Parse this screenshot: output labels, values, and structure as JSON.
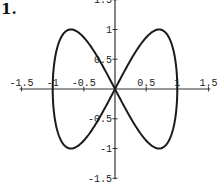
{
  "problem": {
    "number_label": "1."
  },
  "chart_data": {
    "type": "line",
    "title": "",
    "xlabel": "",
    "ylabel": "",
    "parametric": {
      "x": "sin(t)",
      "y": "sin(2t)",
      "t_range": [
        0,
        6.2832
      ]
    },
    "x": [
      0,
      0.383,
      0.707,
      0.924,
      1.0,
      0.924,
      0.707,
      0.383,
      0,
      -0.383,
      -0.707,
      -0.924,
      -1.0,
      -0.924,
      -0.707,
      -0.383,
      0
    ],
    "series": [
      {
        "name": "curve",
        "values": [
          0,
          0.707,
          1.0,
          0.707,
          0,
          -0.707,
          -1.0,
          -0.707,
          0,
          0.707,
          1.0,
          0.707,
          0,
          -0.707,
          -1.0,
          -0.707,
          0
        ]
      }
    ],
    "xlim": [
      -1.5,
      1.5
    ],
    "ylim": [
      -1.5,
      1.5
    ],
    "x_ticks": [
      -1.5,
      -1,
      -0.5,
      0.5,
      1,
      1.5
    ],
    "x_tick_labels": [
      "-1.5",
      "-1",
      "-0.5",
      "0.5",
      "1",
      "1.5"
    ],
    "y_ticks": [
      1.5,
      1,
      0.5,
      -0.5,
      -1,
      -1.5
    ],
    "y_tick_labels": [
      "1.5",
      "1",
      "0.5",
      "-0.5",
      "-1",
      "-1.5"
    ],
    "grid": false,
    "legend": null,
    "axes_style": "centered at origin"
  }
}
